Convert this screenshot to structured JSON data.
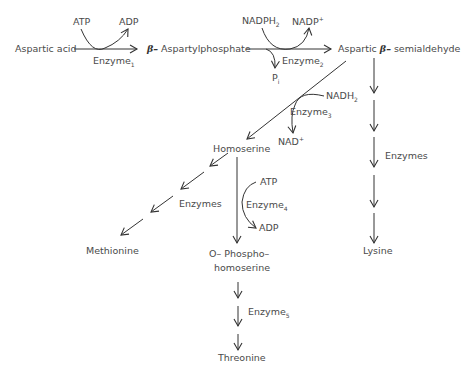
{
  "diagram": {
    "nodes": {
      "aspartic_acid": "Aspartic acid",
      "aspartylphosphate_prefix": "β–",
      "aspartylphosphate": "Aspartylphosphate",
      "semialdehyde_a": "Aspartic",
      "semialdehyde_beta": "β–",
      "semialdehyde_b": "semialdehyde",
      "homoserine": "Homoserine",
      "methionine": "Methionine",
      "lysine": "Lysine",
      "phospho_line1": "O– Phospho–",
      "phospho_line2": "homoserine",
      "threonine": "Threonine"
    },
    "cofactors": {
      "atp1": "ATP",
      "adp1": "ADP",
      "nadph2": "NADPH",
      "nadph2_sub": "2",
      "nadp": "NADP",
      "nadp_sup": "+",
      "pi": "P",
      "pi_sub": "i",
      "nadh2": "NADH",
      "nadh2_sub": "2",
      "nad": "NAD",
      "nad_sup": "+",
      "atp2": "ATP",
      "adp2": "ADP"
    },
    "enzymes": {
      "e1": "Enzyme",
      "e1_sub": "1",
      "e2": "Enzyme",
      "e2_sub": "2",
      "e3": "Enzyme",
      "e3_sub": "3",
      "e4": "Enzyme",
      "e4_sub": "4",
      "e5": "Enzyme",
      "e5_sub": "5",
      "methionine_branch": "Enzymes",
      "lysine_branch": "Enzymes"
    },
    "colors": {
      "line": "#333333",
      "text": "#4a4a4a"
    }
  }
}
